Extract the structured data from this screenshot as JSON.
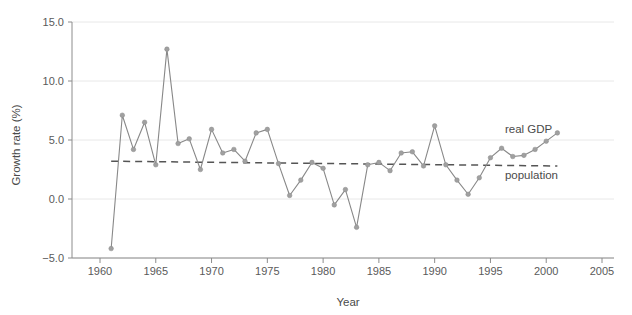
{
  "chart_data": {
    "type": "line",
    "title": "",
    "xlabel": "Year",
    "ylabel": "Growth rate (%)",
    "xlim": [
      1958.5,
      2005.8
    ],
    "ylim": [
      -5.0,
      15.0
    ],
    "grid": true,
    "legend_position": "inline-annotation",
    "xticks": [
      1960,
      1965,
      1970,
      1975,
      1980,
      1985,
      1990,
      1995,
      2000,
      2005
    ],
    "xtick_labels": [
      "1960",
      "1965",
      "1970",
      "1975",
      "1980",
      "1985",
      "1990",
      "1995",
      "2000",
      "2005"
    ],
    "yticks": [
      -5.0,
      0.0,
      5.0,
      10.0,
      15.0
    ],
    "ytick_labels": [
      "-5.0",
      "0.0",
      "5.0",
      "10.0",
      "15.0"
    ],
    "series": [
      {
        "name": "real GDP",
        "style": "solid-with-markers",
        "color": "#888888",
        "annotation": "real GDP",
        "annotation_x": 1996.3,
        "annotation_y": 5.6,
        "x": [
          1961,
          1962,
          1963,
          1964,
          1965,
          1966,
          1967,
          1968,
          1969,
          1970,
          1971,
          1972,
          1973,
          1974,
          1975,
          1976,
          1977,
          1978,
          1979,
          1980,
          1981,
          1982,
          1983,
          1984,
          1985,
          1986,
          1987,
          1988,
          1989,
          1990,
          1991,
          1992,
          1993,
          1994,
          1995,
          1996,
          1997,
          1998,
          1999,
          2000,
          2001
        ],
        "values": [
          -4.2,
          7.1,
          4.2,
          6.5,
          2.9,
          12.7,
          4.7,
          5.1,
          2.5,
          5.9,
          3.9,
          4.2,
          3.2,
          5.6,
          5.9,
          3.0,
          0.3,
          1.6,
          3.1,
          2.6,
          -0.5,
          0.8,
          -2.4,
          2.9,
          3.1,
          2.4,
          3.9,
          4.0,
          2.8,
          6.2,
          2.9,
          1.6,
          0.4,
          1.8,
          3.5,
          4.3,
          3.6,
          3.7,
          4.2,
          4.9,
          5.6
        ]
      },
      {
        "name": "population",
        "style": "dashed",
        "color": "#555555",
        "annotation": "population",
        "annotation_x": 1996.3,
        "annotation_y": 1.7,
        "x": [
          1961,
          2001
        ],
        "values": [
          3.2,
          2.8
        ]
      }
    ]
  },
  "axes": {
    "y_axis_title": "Growth rate (%)",
    "x_axis_title": "Year"
  },
  "annotations": {
    "real_gdp_label": "real GDP",
    "population_label": "population"
  },
  "colors": {
    "gdp_line": "#888888",
    "gdp_marker": "#a0a0a0",
    "population_line": "#555555",
    "gridline": "#e8e8e8",
    "axis": "#8c8c8c",
    "text": "#5a5a5a",
    "background": "#ffffff"
  }
}
